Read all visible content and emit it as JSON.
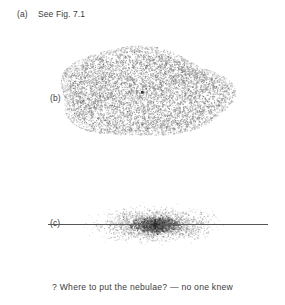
{
  "figure": {
    "panel_a": {
      "label": "(a)",
      "text": "See Fig. 7.1"
    },
    "panel_b": {
      "label": "(b)",
      "description": "dense elliptical star cloud with marked center",
      "center_marker": true
    },
    "panel_c": {
      "label": "(c)",
      "description": "flattened galactic disk: horizontal plane line with concentrated scatter of stars",
      "plane_line": true
    },
    "caption": "? Where to put the nebulae? — no one knew",
    "colors": {
      "ink": "#3b3b3b",
      "stipple": "#9a9a9a",
      "stipple_dark": "#4a4a4a",
      "line": "#555555",
      "background": "#ffffff"
    }
  }
}
